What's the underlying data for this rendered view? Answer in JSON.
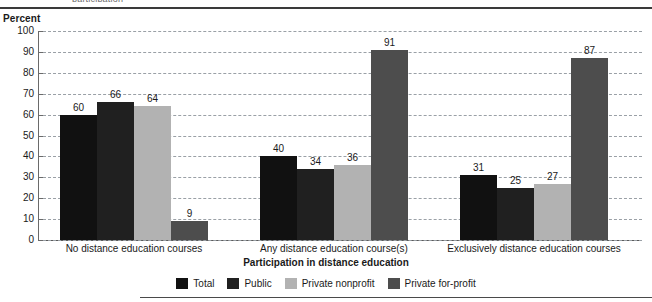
{
  "page": {
    "top_cut_text": "participation",
    "y_axis_title": "Percent"
  },
  "chart_data": {
    "type": "bar",
    "title": "",
    "xlabel": "Participation in distance education",
    "ylabel": "Percent",
    "ylim": [
      0,
      100
    ],
    "ytick_step": 10,
    "yticks": [
      "100",
      "90",
      "80",
      "70",
      "60",
      "50",
      "40",
      "30",
      "20",
      "10",
      "0"
    ],
    "grid": true,
    "legend_position": "bottom-center",
    "categories": [
      "No distance education courses",
      "Any distance education course(s)",
      "Exclusively distance education courses"
    ],
    "series": [
      {
        "name": "Total",
        "color": "#111111",
        "values": [
          60,
          40,
          31
        ]
      },
      {
        "name": "Public",
        "color": "#202020",
        "values": [
          66,
          34,
          25
        ]
      },
      {
        "name": "Private nonprofit",
        "color": "#b2b2b2",
        "values": [
          64,
          36,
          27
        ]
      },
      {
        "name": "Private for-profit",
        "color": "#4d4d4d",
        "values": [
          9,
          91,
          87
        ]
      }
    ]
  }
}
